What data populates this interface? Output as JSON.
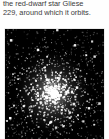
{
  "caption": {
    "lines": [
      "the red-dwarf star Gliese",
      "229, around which it orbits."
    ],
    "full_text": "the red-dwarf star Gliese 229, around which it orbits.",
    "text_color": "#3b3b3b"
  },
  "figure": {
    "name": "globular-star-cluster-photograph",
    "alt": "Dense globular star cluster: bright concentrated core of stars fading into a scattered halo on a black sky",
    "background_color": "#000000",
    "star_color": "#ffffff",
    "core": {
      "center_x_pct": 48,
      "center_y_pct": 58,
      "glow_radius_pct": 34
    }
  },
  "page": {
    "background_color": "#ffffff",
    "width": 109,
    "height": 139
  }
}
